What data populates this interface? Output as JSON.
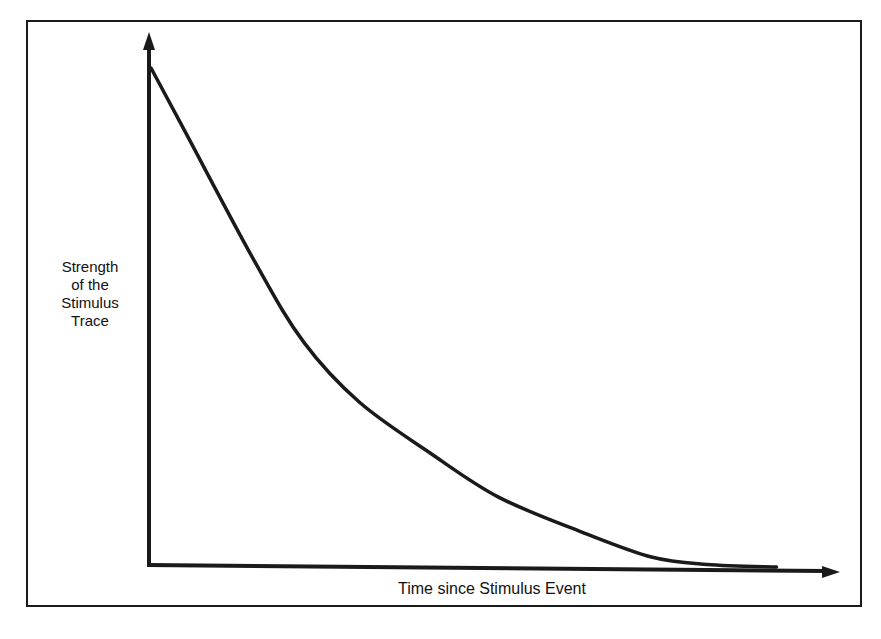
{
  "chart_data": {
    "type": "line",
    "title": "",
    "xlabel": "Time since Stimulus Event",
    "ylabel": "Strength of the Stimulus Trace",
    "ylabel_lines": [
      "Strength",
      "of the",
      "Stimulus",
      "Trace"
    ],
    "x_ticks": [],
    "y_ticks": [],
    "grid": false,
    "legend": null,
    "units": "relative (axes unlabeled; values estimated as fraction of axis length)",
    "series": [
      {
        "name": "Stimulus trace decay",
        "x": [
          0.0,
          0.05,
          0.15,
          0.22,
          0.3,
          0.4,
          0.5,
          0.62,
          0.72,
          0.8,
          0.9
        ],
        "y": [
          1.0,
          0.87,
          0.61,
          0.45,
          0.33,
          0.23,
          0.14,
          0.07,
          0.02,
          0.005,
          0.0
        ]
      }
    ],
    "xlim": [
      0,
      1
    ],
    "ylim": [
      0,
      1.07
    ],
    "color": "#1a1a1a"
  },
  "axes": {
    "x_label": "Time since Stimulus Event",
    "y_label_lines": [
      "Strength",
      "of the",
      "Stimulus",
      "Trace"
    ]
  }
}
